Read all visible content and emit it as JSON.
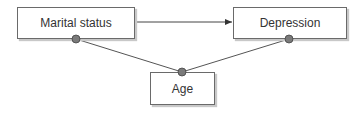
{
  "diagram": {
    "nodes": [
      {
        "id": "marital",
        "label": "Marital status"
      },
      {
        "id": "depression",
        "label": "Depression"
      },
      {
        "id": "age",
        "label": "Age"
      }
    ],
    "edges": [
      {
        "from": "marital",
        "to": "depression",
        "type": "arrow"
      },
      {
        "from": "age",
        "to": "marital",
        "type": "line-dot"
      },
      {
        "from": "age",
        "to": "depression",
        "type": "line-dot"
      }
    ],
    "colors": {
      "line": "#444444",
      "dot": "#7a7a7a",
      "border": "#6a6a6a"
    }
  }
}
